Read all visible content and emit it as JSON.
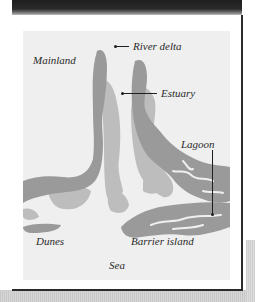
{
  "figure": {
    "type": "coastal landform schematic map",
    "colors": {
      "frame": "#2b2b2b",
      "map_background": "#efefef",
      "land_dark": "#9a9a9a",
      "land_light": "#bdbdbd",
      "text": "#2a2a2a"
    },
    "labels": {
      "river_delta": "River delta",
      "mainland": "Mainland",
      "estuary": "Estuary",
      "lagoon": "Lagoon",
      "dunes": "Dunes",
      "barrier_island": "Barrier island",
      "sea": "Sea"
    }
  }
}
